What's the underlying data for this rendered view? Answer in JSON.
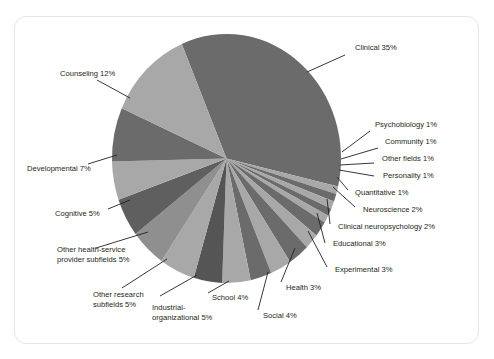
{
  "figure": {
    "kind": "pie-chart-figure",
    "frame_border_color": "#e6e6e6",
    "background_color": "#ffffff"
  },
  "chart_data": {
    "type": "pie",
    "title": "",
    "subtitle": "",
    "xlabel": "",
    "ylabel": "",
    "legend_position": "none",
    "grid": false,
    "label_format": "{name} {value}%",
    "start_angle_deg": -23,
    "direction": "clockwise",
    "total_percent": 100,
    "categories": [
      "Clinical",
      "Psychobiology",
      "Community",
      "Other fields",
      "Personality",
      "Quantitative",
      "Neuroscience",
      "Clinical neuropsychology",
      "Educational",
      "Experimental",
      "Health",
      "Social",
      "School",
      "Industrial-organizational",
      "Other research subfields",
      "Other health-service provider subfields",
      "Cognitive",
      "Developmental",
      "Counseling"
    ],
    "values": [
      35,
      1,
      1,
      1,
      1,
      1,
      2,
      2,
      3,
      3,
      3,
      4,
      4,
      5,
      5,
      5,
      5,
      7,
      12
    ],
    "colors": [
      "#6b6b6b",
      "#a8a8a8",
      "#6b6b6b",
      "#a8a8a8",
      "#6b6b6b",
      "#a8a8a8",
      "#6b6b6b",
      "#a8a8a8",
      "#6b6b6b",
      "#a8a8a8",
      "#6b6b6b",
      "#a8a8a8",
      "#555555",
      "#a8a8a8",
      "#8f8f8f",
      "#5f5f5f",
      "#a8a8a8",
      "#6b6b6b",
      "#a8a8a8"
    ],
    "slice_palette": {
      "dark": "#6b6b6b",
      "light": "#a8a8a8",
      "darker": "#555555",
      "mid": "#8f8f8f"
    }
  },
  "labels": [
    {
      "id": "clinical",
      "lines": [
        "Clinical 35%"
      ]
    },
    {
      "id": "psychobiology",
      "lines": [
        "Psychobiology 1%"
      ]
    },
    {
      "id": "community",
      "lines": [
        "Community 1%"
      ]
    },
    {
      "id": "other-fields",
      "lines": [
        "Other fields 1%"
      ]
    },
    {
      "id": "personality",
      "lines": [
        "Personality 1%"
      ]
    },
    {
      "id": "quantitative",
      "lines": [
        "Quantitative 1%"
      ]
    },
    {
      "id": "neuroscience",
      "lines": [
        "Neuroscience 2%"
      ]
    },
    {
      "id": "clinical-neuropsychology",
      "lines": [
        "Clinical neuropsychology 2%"
      ]
    },
    {
      "id": "educational",
      "lines": [
        "Educational 3%"
      ]
    },
    {
      "id": "experimental",
      "lines": [
        "Experimental 3%"
      ]
    },
    {
      "id": "health",
      "lines": [
        "Health 3%"
      ]
    },
    {
      "id": "social",
      "lines": [
        "Social 4%"
      ]
    },
    {
      "id": "school",
      "lines": [
        "School 4%"
      ]
    },
    {
      "id": "industrial-organizational",
      "lines": [
        "Industrial-",
        "organizational 5%"
      ]
    },
    {
      "id": "other-research-subfields",
      "lines": [
        "Other research",
        "subfields 5%"
      ]
    },
    {
      "id": "other-health-service",
      "lines": [
        "Other health-service",
        "provider subfields 5%"
      ]
    },
    {
      "id": "cognitive",
      "lines": [
        "Cognitive 5%"
      ]
    },
    {
      "id": "developmental",
      "lines": [
        "Developmental 7%"
      ]
    },
    {
      "id": "counseling",
      "lines": [
        "Counseling 12%"
      ]
    }
  ]
}
